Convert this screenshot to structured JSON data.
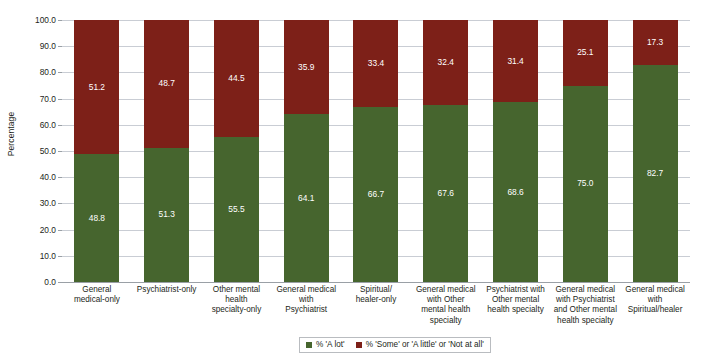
{
  "chart_data": {
    "type": "bar",
    "subtype": "stacked-100-percent",
    "title": "",
    "xlabel": "",
    "ylabel": "Percentage",
    "ylim": [
      0,
      100
    ],
    "ytick_labels": [
      "0.0",
      "10.0",
      "20.0",
      "30.0",
      "40.0",
      "50.0",
      "60.0",
      "70.0",
      "80.0",
      "90.0",
      "100.0"
    ],
    "ytick_values": [
      0,
      10,
      20,
      30,
      40,
      50,
      60,
      70,
      80,
      90,
      100
    ],
    "grid": true,
    "legend_position": "bottom-center",
    "categories": [
      "General medical-only",
      "Psychiatrist-only",
      "Other mental health specialty-only",
      "General medical with Psychiatrist",
      "Spiritual/ healer-only",
      "General medical with Other mental health specialty",
      "Psychiatrist with Other mental health specialty",
      "General medical with Psychiatrist and Other mental health specialty",
      "General medical with Spiritual/healer"
    ],
    "category_lines": [
      [
        "General",
        "medical-only"
      ],
      [
        "Psychiatrist-only"
      ],
      [
        "Other mental",
        "health",
        "specialty-only"
      ],
      [
        "General medical",
        "with",
        "Psychiatrist"
      ],
      [
        "Spiritual/",
        "healer-only"
      ],
      [
        "General medical",
        "with Other",
        "mental health",
        "specialty"
      ],
      [
        "Psychiatrist with",
        "Other mental",
        "health specialty"
      ],
      [
        "General medical",
        "with Psychiatrist",
        "and Other mental",
        "health specialty"
      ],
      [
        "General medical",
        "with",
        "Spiritual/healer"
      ]
    ],
    "series": [
      {
        "name": "% 'A lot'",
        "color": "#46652e",
        "values": [
          48.8,
          51.3,
          55.5,
          64.1,
          66.7,
          67.6,
          68.6,
          75.0,
          82.7
        ],
        "labels": [
          "48.8",
          "51.3",
          "55.5",
          "64.1",
          "66.7",
          "67.6",
          "68.6",
          "75.0",
          "82.7"
        ]
      },
      {
        "name": "% 'Some' or 'A little' or 'Not at all'",
        "color": "#7d2018",
        "values": [
          51.2,
          48.7,
          44.5,
          35.9,
          33.4,
          32.4,
          31.4,
          25.1,
          17.3
        ],
        "labels": [
          "51.2",
          "48.7",
          "44.5",
          "35.9",
          "33.4",
          "32.4",
          "31.4",
          "25.1",
          "17.3"
        ]
      }
    ],
    "colors": {
      "a_lot_green": "#46652e",
      "some_little_none_red": "#7d2018",
      "gridline": "#c9cdd4",
      "axis": "#9aa0a6",
      "text": "#231f20",
      "value_label": "#ffffff"
    }
  },
  "legend": {
    "items": [
      {
        "label": "% 'A lot'",
        "color": "#46652e"
      },
      {
        "label": "% 'Some' or 'A little' or 'Not at all'",
        "color": "#7d2018"
      }
    ]
  }
}
